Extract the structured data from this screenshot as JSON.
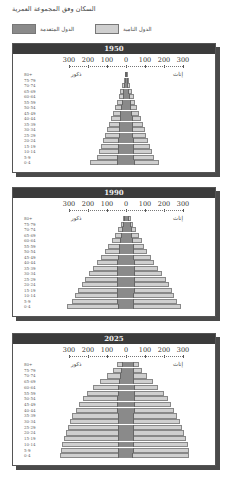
{
  "title": "السكان وفق المجموعة العمرية",
  "legend": [
    {
      "label": "الدول المتقدمة",
      "color": "#8a8a8a"
    },
    {
      "label": "الدول النامية",
      "color": "#cfcfcf"
    }
  ],
  "labels": {
    "males": "ذكور",
    "females": "إناث"
  },
  "axis_ticks": [
    "300",
    "200",
    "100",
    "0",
    "100",
    "200",
    "300"
  ],
  "age_groups": [
    "80+",
    "75-79",
    "70-74",
    "65-69",
    "60-64",
    "55-59",
    "50-54",
    "45-49",
    "40-44",
    "35-39",
    "30-34",
    "25-29",
    "20-24",
    "15-19",
    "10-14",
    "5-9",
    "0-4"
  ],
  "chart_data": [
    {
      "type": "bar",
      "title": "1950",
      "xlabel": "",
      "ylabel": "",
      "categories": [
        "80+",
        "75-79",
        "70-74",
        "65-69",
        "60-64",
        "55-59",
        "50-54",
        "45-49",
        "40-44",
        "35-39",
        "30-34",
        "25-29",
        "20-24",
        "15-19",
        "10-14",
        "5-9",
        "0-4"
      ],
      "xlim": [
        -300,
        300
      ],
      "series": [
        {
          "name": "الدول المتقدمة - ذكور",
          "values": [
            4,
            7,
            10,
            14,
            18,
            22,
            26,
            30,
            33,
            35,
            37,
            38,
            40,
            42,
            43,
            45,
            48
          ]
        },
        {
          "name": "الدول النامية - ذكور",
          "values": [
            3,
            6,
            10,
            15,
            20,
            26,
            32,
            40,
            48,
            56,
            63,
            72,
            80,
            88,
            98,
            110,
            140
          ]
        },
        {
          "name": "الدول المتقدمة - إناث",
          "values": [
            7,
            10,
            13,
            17,
            21,
            25,
            28,
            32,
            35,
            37,
            38,
            39,
            40,
            41,
            42,
            44,
            46
          ]
        },
        {
          "name": "الدول النامية - إناث",
          "values": [
            3,
            6,
            10,
            14,
            19,
            25,
            30,
            37,
            44,
            52,
            60,
            68,
            76,
            84,
            94,
            104,
            130
          ]
        }
      ]
    },
    {
      "type": "bar",
      "title": "1990",
      "xlabel": "",
      "ylabel": "",
      "categories": [
        "80+",
        "75-79",
        "70-74",
        "65-69",
        "60-64",
        "55-59",
        "50-54",
        "45-49",
        "40-44",
        "35-39",
        "30-34",
        "25-29",
        "20-24",
        "15-19",
        "10-14",
        "5-9",
        "0-4"
      ],
      "xlim": [
        -300,
        300
      ],
      "series": [
        {
          "name": "الدول المتقدمة - ذكور",
          "values": [
            8,
            14,
            20,
            26,
            32,
            36,
            38,
            42,
            46,
            48,
            50,
            50,
            48,
            46,
            45,
            45,
            44
          ]
        },
        {
          "name": "الدول النامية - ذكور",
          "values": [
            8,
            14,
            22,
            32,
            44,
            58,
            72,
            88,
            105,
            125,
            145,
            165,
            185,
            205,
            222,
            240,
            265
          ]
        },
        {
          "name": "الدول المتقدمة - إناث",
          "values": [
            18,
            24,
            30,
            34,
            38,
            40,
            40,
            43,
            46,
            48,
            49,
            49,
            47,
            45,
            43,
            43,
            42
          ]
        },
        {
          "name": "الدول النامية - إناث",
          "values": [
            8,
            14,
            22,
            32,
            44,
            56,
            70,
            86,
            102,
            120,
            140,
            160,
            178,
            196,
            212,
            228,
            250
          ]
        }
      ]
    },
    {
      "type": "bar",
      "title": "2025",
      "xlabel": "",
      "ylabel": "",
      "categories": [
        "80+",
        "75-79",
        "70-74",
        "65-69",
        "60-64",
        "55-59",
        "50-54",
        "45-49",
        "40-44",
        "35-39",
        "30-34",
        "25-29",
        "20-24",
        "15-19",
        "10-14",
        "5-9",
        "0-4"
      ],
      "xlim": [
        -300,
        300
      ],
      "series": [
        {
          "name": "الدول المتقدمة - ذكور",
          "values": [
            20,
            26,
            32,
            38,
            42,
            44,
            46,
            46,
            45,
            44,
            44,
            43,
            43,
            42,
            42,
            41,
            41
          ]
        },
        {
          "name": "الدول النامية - ذكور",
          "values": [
            25,
            45,
            70,
            100,
            130,
            160,
            180,
            200,
            220,
            238,
            250,
            262,
            275,
            285,
            295,
            300,
            305
          ]
        },
        {
          "name": "الدول المتقدمة - إناث",
          "values": [
            40,
            40,
            42,
            44,
            46,
            46,
            47,
            46,
            45,
            44,
            43,
            42,
            42,
            41,
            40,
            40,
            39
          ]
        },
        {
          "name": "الدول النامية - إناث",
          "values": [
            30,
            45,
            68,
            96,
            125,
            152,
            172,
            192,
            210,
            226,
            240,
            252,
            264,
            274,
            284,
            290,
            295
          ]
        }
      ]
    }
  ]
}
